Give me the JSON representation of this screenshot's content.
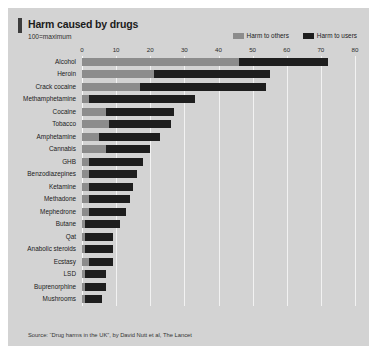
{
  "card": {
    "title": "Harm caused by drugs",
    "subtitle": "100=maximum",
    "source": "Source: “Drug harms in the UK”, by David Nutt et al, The Lancet"
  },
  "colors": {
    "harm_to_others": "#8c8c8c",
    "harm_to_users": "#1e1e1e",
    "panel_background": "#d3d3d3",
    "gridline": "#f2f2f2",
    "accent_rule": "#3c3c3c"
  },
  "legend": [
    {
      "label": "Harm to others",
      "color": "#8c8c8c"
    },
    {
      "label": "Harm to users",
      "color": "#1e1e1e"
    }
  ],
  "chart_data": {
    "type": "bar",
    "orientation": "horizontal",
    "stacked": true,
    "title": "Harm caused by drugs",
    "subtitle": "100=maximum",
    "xlabel": "",
    "ylabel": "",
    "xlim": [
      0,
      80
    ],
    "xticks": [
      0,
      10,
      20,
      30,
      40,
      50,
      60,
      70,
      80
    ],
    "xticklabels": [
      "0",
      "10",
      "20",
      "30",
      "40",
      "50",
      "60",
      "70",
      "80"
    ],
    "grid": "vertical",
    "legend_position": "top-right",
    "categories": [
      "Alcohol",
      "Heroin",
      "Crack cocaine",
      "Methamphetamine",
      "Cocaine",
      "Tobacco",
      "Amphetamine",
      "Cannabis",
      "GHB",
      "Benzodiazepines",
      "Ketamine",
      "Methadone",
      "Mephedrone",
      "Butane",
      "Qat",
      "Anabolic steroids",
      "Ecstasy",
      "LSD",
      "Buprenorphine",
      "Mushrooms"
    ],
    "series": [
      {
        "name": "Harm to others",
        "color": "#8c8c8c",
        "values": [
          46,
          21,
          17,
          2,
          7,
          8,
          5,
          7,
          2,
          2,
          2,
          2,
          2,
          1,
          1,
          1,
          2,
          1,
          1,
          1
        ]
      },
      {
        "name": "Harm to users",
        "color": "#1e1e1e",
        "values": [
          26,
          34,
          37,
          31,
          20,
          18,
          18,
          13,
          16,
          14,
          13,
          12,
          11,
          10,
          8,
          8,
          7,
          6,
          6,
          5
        ]
      }
    ],
    "totals": [
      72,
      55,
      54,
      33,
      27,
      26,
      23,
      20,
      18,
      16,
      15,
      14,
      13,
      11,
      9,
      9,
      9,
      7,
      7,
      6
    ],
    "source": "Source: “Drug harms in the UK”, by David Nutt et al, The Lancet"
  }
}
